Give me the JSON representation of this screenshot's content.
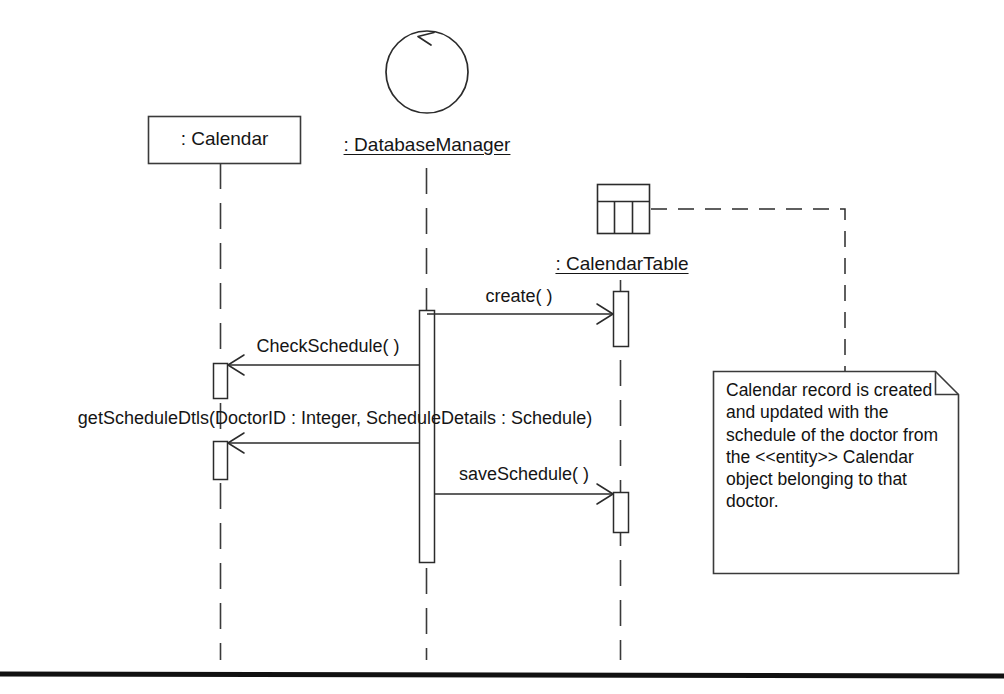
{
  "diagram": {
    "kind": "uml-sequence-diagram",
    "participants": [
      {
        "id": "calendar",
        "name": ": Calendar",
        "stereotype_icon": "object-box-icon",
        "underlined": false
      },
      {
        "id": "databasemanager",
        "name": ": DatabaseManager",
        "stereotype_icon": "control-circle-icon",
        "underlined": true
      },
      {
        "id": "calendartable",
        "name": ": CalendarTable",
        "stereotype_icon": "table-icon",
        "underlined": true
      }
    ],
    "messages": [
      {
        "id": "m1",
        "label": "create( )",
        "from": "databasemanager",
        "to": "calendartable",
        "direction": "right"
      },
      {
        "id": "m2",
        "label": "CheckSchedule( )",
        "from": "databasemanager",
        "to": "calendar",
        "direction": "left"
      },
      {
        "id": "m3",
        "label": "getScheduleDtls(DoctorID : Integer, ScheduleDetails : Schedule)",
        "from": "databasemanager",
        "to": "calendar",
        "direction": "left"
      },
      {
        "id": "m4",
        "label": "saveSchedule( )",
        "from": "databasemanager",
        "to": "calendartable",
        "direction": "right"
      }
    ],
    "note": {
      "text": "Calendar record is created and updated with the schedule of the doctor from the <<entity>> Calendar object belonging to that doctor.",
      "attached_to": "calendartable"
    },
    "colors": {
      "stroke": "#2b2b2b",
      "background": "#ffffff",
      "text": "#151515",
      "rule": "#111111"
    }
  }
}
